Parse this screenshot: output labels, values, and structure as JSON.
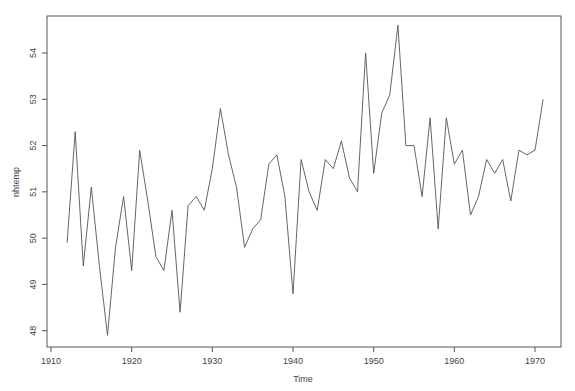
{
  "chart_data": {
    "type": "line",
    "title": "",
    "xlabel": "Time",
    "ylabel": "nhtemp",
    "xlim": [
      1908.5,
      1973.5
    ],
    "ylim": [
      47.6,
      54.8
    ],
    "grid": false,
    "legend": null,
    "x_ticks": [
      1910,
      1920,
      1930,
      1940,
      1950,
      1960,
      1970
    ],
    "y_ticks": [
      48,
      49,
      50,
      51,
      52,
      53,
      54
    ],
    "x": [
      1912,
      1913,
      1914,
      1915,
      1916,
      1917,
      1918,
      1919,
      1920,
      1921,
      1922,
      1923,
      1924,
      1925,
      1926,
      1927,
      1928,
      1929,
      1930,
      1931,
      1932,
      1933,
      1934,
      1935,
      1936,
      1937,
      1938,
      1939,
      1940,
      1941,
      1942,
      1943,
      1944,
      1945,
      1946,
      1947,
      1948,
      1949,
      1950,
      1951,
      1952,
      1953,
      1954,
      1955,
      1956,
      1957,
      1958,
      1959,
      1960,
      1961,
      1962,
      1963,
      1964,
      1965,
      1966,
      1967,
      1968,
      1969,
      1970,
      1971
    ],
    "series": [
      {
        "name": "nhtemp",
        "color": "#555555",
        "values": [
          49.9,
          52.3,
          49.4,
          51.1,
          49.4,
          47.9,
          49.8,
          50.9,
          49.3,
          51.9,
          50.8,
          49.6,
          49.3,
          50.6,
          48.4,
          50.7,
          50.9,
          50.6,
          51.5,
          52.8,
          51.8,
          51.1,
          49.8,
          50.2,
          50.4,
          51.6,
          51.8,
          50.9,
          48.8,
          51.7,
          51.0,
          50.6,
          51.7,
          51.5,
          52.1,
          51.3,
          51.0,
          54.0,
          51.4,
          52.7,
          53.1,
          54.6,
          52.0,
          52.0,
          50.9,
          52.6,
          50.2,
          52.6,
          51.6,
          51.9,
          50.5,
          50.9,
          51.7,
          51.4,
          51.7,
          50.8,
          51.9,
          51.8,
          51.9,
          53.0
        ]
      }
    ]
  }
}
